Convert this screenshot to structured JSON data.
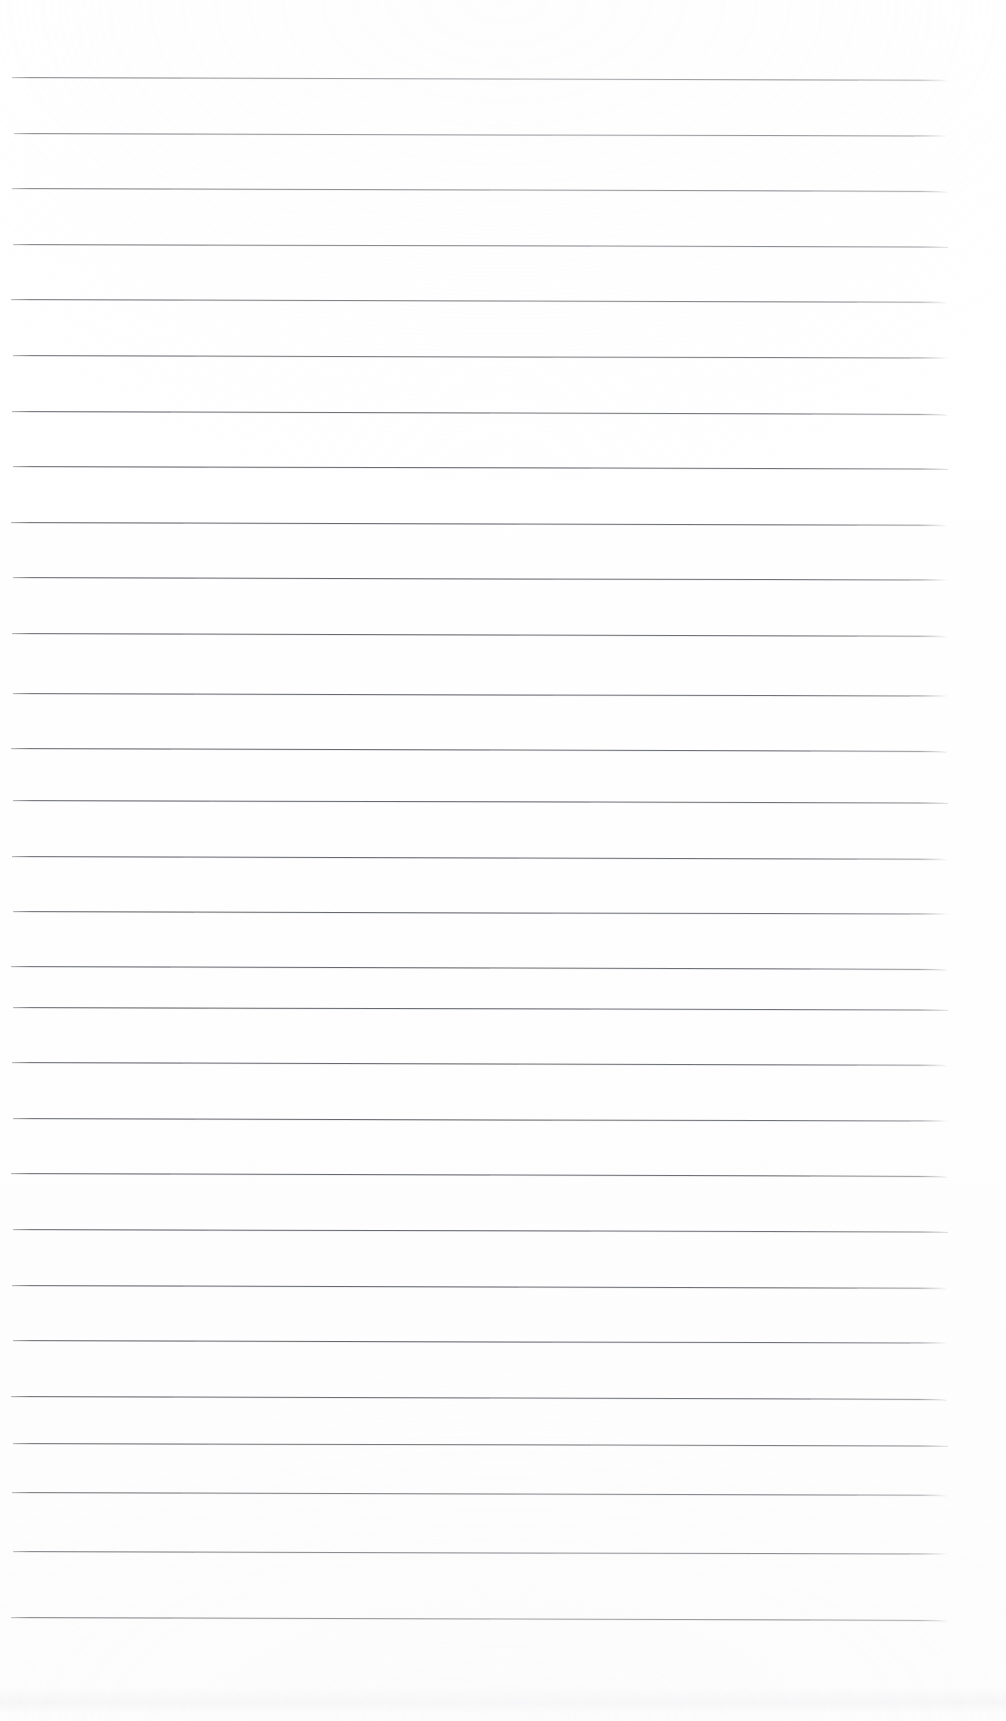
{
  "document": {
    "kind": "scanned-ruled-notepad-page",
    "title": "Lined Notepad Page",
    "page_width": 1006,
    "page_height": 1721,
    "background_color": "#fefefe",
    "text_content": "",
    "has_handwriting": false,
    "has_printed_text": false
  },
  "ruling": {
    "line_color": "#686b70",
    "line_thickness_px": 1.2,
    "line_count": 28,
    "first_line_y": 77,
    "line_spacing_px": 55.6,
    "last_line_y": 1617,
    "line_start_x": 11,
    "line_end_x": 948,
    "line_length_px": 937,
    "skew_degrees": 0.16,
    "top_margin_px": 77,
    "bottom_margin_px": 104,
    "left_margin_px": 11,
    "right_margin_px": 58
  },
  "lines": [
    {
      "index": 1,
      "y": 77,
      "x1": 12,
      "x2": 948,
      "skew": 0.17
    },
    {
      "index": 2,
      "y": 133,
      "x1": 14,
      "x2": 948,
      "skew": 0.16
    },
    {
      "index": 3,
      "y": 188,
      "x1": 12,
      "x2": 947,
      "skew": 0.18
    },
    {
      "index": 4,
      "y": 244,
      "x1": 13,
      "x2": 948,
      "skew": 0.15
    },
    {
      "index": 5,
      "y": 299,
      "x1": 11,
      "x2": 947,
      "skew": 0.17
    },
    {
      "index": 6,
      "y": 355,
      "x1": 13,
      "x2": 948,
      "skew": 0.16
    },
    {
      "index": 7,
      "y": 411,
      "x1": 12,
      "x2": 947,
      "skew": 0.18
    },
    {
      "index": 8,
      "y": 466,
      "x1": 13,
      "x2": 948,
      "skew": 0.15
    },
    {
      "index": 9,
      "y": 522,
      "x1": 11,
      "x2": 947,
      "skew": 0.17
    },
    {
      "index": 10,
      "y": 577,
      "x1": 13,
      "x2": 948,
      "skew": 0.16
    },
    {
      "index": 11,
      "y": 633,
      "x1": 12,
      "x2": 947,
      "skew": 0.17
    },
    {
      "index": 12,
      "y": 693,
      "x1": 13,
      "x2": 948,
      "skew": 0.16
    },
    {
      "index": 13,
      "y": 748,
      "x1": 11,
      "x2": 947,
      "skew": 0.18
    },
    {
      "index": 14,
      "y": 800,
      "x1": 13,
      "x2": 948,
      "skew": 0.15
    },
    {
      "index": 15,
      "y": 856,
      "x1": 12,
      "x2": 947,
      "skew": 0.17
    },
    {
      "index": 16,
      "y": 911,
      "x1": 13,
      "x2": 948,
      "skew": 0.16
    },
    {
      "index": 17,
      "y": 966,
      "x1": 11,
      "x2": 947,
      "skew": 0.18
    },
    {
      "index": 18,
      "y": 1007,
      "x1": 13,
      "x2": 948,
      "skew": 0.15
    },
    {
      "index": 19,
      "y": 1062,
      "x1": 12,
      "x2": 947,
      "skew": 0.17
    },
    {
      "index": 20,
      "y": 1118,
      "x1": 13,
      "x2": 948,
      "skew": 0.16
    },
    {
      "index": 21,
      "y": 1173,
      "x1": 11,
      "x2": 947,
      "skew": 0.18
    },
    {
      "index": 22,
      "y": 1229,
      "x1": 13,
      "x2": 948,
      "skew": 0.15
    },
    {
      "index": 23,
      "y": 1285,
      "x1": 12,
      "x2": 947,
      "skew": 0.17
    },
    {
      "index": 24,
      "y": 1340,
      "x1": 13,
      "x2": 948,
      "skew": 0.16
    },
    {
      "index": 25,
      "y": 1396,
      "x1": 11,
      "x2": 947,
      "skew": 0.18
    },
    {
      "index": 26,
      "y": 1443,
      "x1": 13,
      "x2": 948,
      "skew": 0.15
    },
    {
      "index": 27,
      "y": 1492,
      "x1": 12,
      "x2": 947,
      "skew": 0.17
    },
    {
      "index": 28,
      "y": 1551,
      "x1": 13,
      "x2": 948,
      "skew": 0.16
    },
    {
      "index": 29,
      "y": 1617,
      "x1": 11,
      "x2": 947,
      "skew": 0.18
    }
  ],
  "artifacts": {
    "bottom_smudge": {
      "y": 1688,
      "height": 26,
      "description": "faint gray scanner band along bottom edge"
    }
  }
}
